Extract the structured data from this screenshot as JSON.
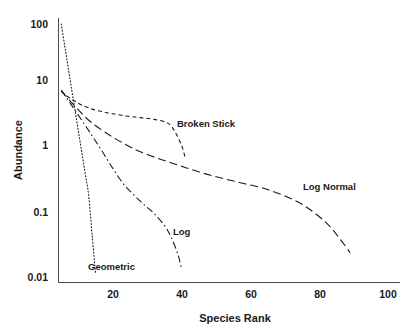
{
  "chart_data": {
    "type": "line",
    "title": "",
    "xlabel": "Species Rank",
    "ylabel": "Abundance",
    "yscale": "log",
    "xlim": [
      0,
      100
    ],
    "ylim": [
      0.01,
      100
    ],
    "grid": false,
    "legend_position": "inline-annotations",
    "xticks": [
      "20",
      "40",
      "60",
      "80",
      "100"
    ],
    "xtick_values": [
      20,
      40,
      60,
      80,
      100
    ],
    "yticks": [
      "100",
      "10",
      "1",
      "0.1",
      "0.01"
    ],
    "ytick_values": [
      100,
      10,
      1,
      0.1,
      0.01
    ],
    "series": [
      {
        "name": "Geometric",
        "label": "Geometric",
        "style": "dotted",
        "x": [
          5,
          6,
          7,
          8,
          9,
          10,
          11,
          12,
          13,
          14,
          15
        ],
        "values": [
          100,
          46,
          21,
          9.5,
          4.4,
          2.0,
          0.92,
          0.42,
          0.19,
          0.045,
          0.011
        ]
      },
      {
        "name": "Broken Stick",
        "label": "Broken Stick",
        "style": "dashed-short",
        "x": [
          5,
          7,
          9,
          11,
          14,
          17,
          20,
          24,
          28,
          32,
          36,
          38,
          40,
          41
        ],
        "values": [
          8.6,
          7.0,
          6.0,
          5.2,
          4.5,
          4.1,
          3.8,
          3.5,
          3.3,
          3.1,
          2.7,
          2.0,
          1.2,
          0.78
        ]
      },
      {
        "name": "Log",
        "label": "Log",
        "style": "dash-dot",
        "x": [
          5,
          8,
          11,
          14,
          17,
          20,
          23,
          26,
          29,
          32,
          35,
          37,
          39,
          40
        ],
        "values": [
          9.0,
          5.2,
          3.0,
          1.7,
          0.95,
          0.52,
          0.3,
          0.2,
          0.14,
          0.1,
          0.065,
          0.042,
          0.022,
          0.013
        ]
      },
      {
        "name": "Log Normal",
        "label": "Log Normal",
        "style": "dashed-long",
        "x": [
          5,
          9,
          13,
          18,
          23,
          28,
          34,
          40,
          46,
          52,
          58,
          64,
          70,
          76,
          82,
          86,
          89
        ],
        "values": [
          8.8,
          5.0,
          3.0,
          1.9,
          1.3,
          0.95,
          0.72,
          0.56,
          0.44,
          0.36,
          0.3,
          0.25,
          0.19,
          0.13,
          0.072,
          0.04,
          0.024
        ]
      }
    ],
    "annotations": [
      {
        "text": "Broken Stick",
        "x_px": 177,
        "y_px": 127
      },
      {
        "text": "Log Normal",
        "x_px": 303,
        "y_px": 190
      },
      {
        "text": "Log",
        "x_px": 173,
        "y_px": 235
      },
      {
        "text": "Geometric",
        "x_px": 88,
        "y_px": 270
      }
    ]
  }
}
